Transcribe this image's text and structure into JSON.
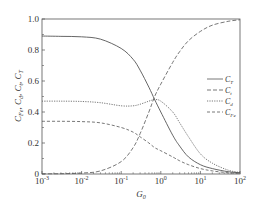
{
  "chart_data": {
    "type": "line",
    "title": "",
    "xlabel": "G_0",
    "ylabel": "C_Fe, C_d, C_t, C_T",
    "xscale": "log",
    "xlim": [
      0.001,
      100
    ],
    "ylim": [
      0,
      1.0
    ],
    "x_ticks": [
      0.001,
      0.01,
      0.1,
      1,
      10,
      100
    ],
    "x_tick_labels": [
      "10^-3",
      "10^-2",
      "10^-1",
      "10^0",
      "10^1",
      "10^2"
    ],
    "y_ticks": [
      0,
      0.2,
      0.4,
      0.6,
      0.8,
      1.0
    ],
    "y_tick_labels": [
      "0",
      "0.2",
      "0.4",
      "0.6",
      "0.8",
      "1.0"
    ],
    "grid": false,
    "legend_position": "right-middle",
    "x": [
      0.001,
      0.003,
      0.01,
      0.03,
      0.1,
      0.2,
      0.3,
      0.5,
      0.7,
      1,
      2,
      3,
      5,
      10,
      20,
      50,
      100
    ],
    "series": [
      {
        "name": "C_T",
        "style": "solid",
        "values": [
          0.89,
          0.888,
          0.885,
          0.87,
          0.81,
          0.74,
          0.67,
          0.56,
          0.48,
          0.4,
          0.25,
          0.18,
          0.11,
          0.06,
          0.035,
          0.015,
          0.008
        ]
      },
      {
        "name": "C_t",
        "style": "long-dash",
        "values": [
          0.001,
          0.002,
          0.006,
          0.02,
          0.08,
          0.17,
          0.26,
          0.4,
          0.5,
          0.58,
          0.72,
          0.79,
          0.86,
          0.92,
          0.96,
          0.985,
          0.995
        ]
      },
      {
        "name": "C_d",
        "style": "dotted",
        "values": [
          0.47,
          0.47,
          0.468,
          0.46,
          0.44,
          0.44,
          0.45,
          0.47,
          0.48,
          0.47,
          0.4,
          0.33,
          0.24,
          0.13,
          0.07,
          0.025,
          0.01
        ]
      },
      {
        "name": "C_Fe",
        "style": "dashed",
        "values": [
          0.34,
          0.34,
          0.338,
          0.33,
          0.3,
          0.27,
          0.24,
          0.2,
          0.17,
          0.15,
          0.11,
          0.085,
          0.06,
          0.035,
          0.02,
          0.008,
          0.004
        ]
      }
    ]
  },
  "axes": {
    "xlabel_main": "G",
    "xlabel_sub": "0",
    "ylabel_parts": [
      {
        "main": "C",
        "sub": "Fe",
        "sep": ", "
      },
      {
        "main": "C",
        "sub": "d",
        "sep": ", "
      },
      {
        "main": "C",
        "sub": "t",
        "sep": ", "
      },
      {
        "main": "C",
        "sub": "T",
        "sep": ""
      }
    ],
    "y_tick_labels": [
      "0",
      "0.2",
      "0.4",
      "0.6",
      "0.8",
      "1.0"
    ],
    "x_tick_bases": [
      "10",
      "10",
      "10",
      "10",
      "10",
      "10"
    ],
    "x_tick_exps": [
      "-3",
      "-2",
      "-1",
      "0",
      "1",
      "2"
    ]
  },
  "legend": [
    {
      "main": "C",
      "sub": "T",
      "style": "solid"
    },
    {
      "main": "C",
      "sub": "t",
      "style": "long-dash"
    },
    {
      "main": "C",
      "sub": "d",
      "style": "dotted"
    },
    {
      "main": "C",
      "sub": "Fe",
      "style": "dashed"
    }
  ],
  "colors": {
    "line": "#555555",
    "axis": "#444444",
    "background": "#ffffff"
  }
}
